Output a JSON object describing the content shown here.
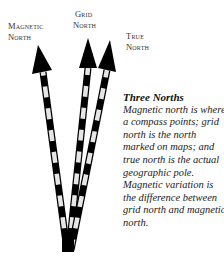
{
  "labels": {
    "magnetic": [
      "Magnetic",
      "North"
    ],
    "grid": [
      "Grid",
      "North"
    ],
    "true": [
      "True",
      "North"
    ]
  },
  "caption": {
    "title": "Three Norths",
    "body": "Magnetic north is where a compass points; grid north is the north marked on maps; and true north is the actual geographic pole. Magnetic variation is the difference between grid north and magnetic north."
  },
  "colors": {
    "arrow": "#000000",
    "stripe_light": "#e6e6e6",
    "text": "#222222"
  }
}
